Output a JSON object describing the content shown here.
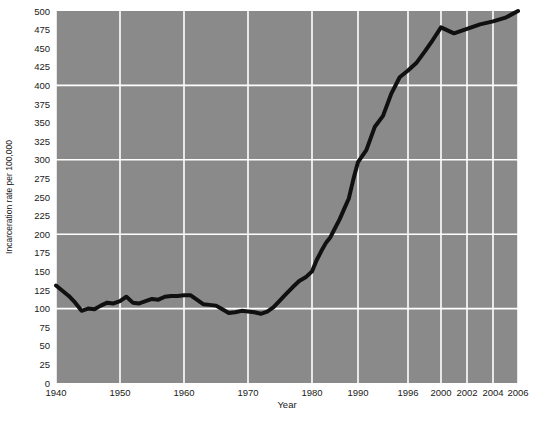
{
  "chart_data": {
    "type": "line",
    "title": "",
    "xlabel": "Year",
    "ylabel": "Incarceration rate per 100,000",
    "ylim": [
      0,
      500
    ],
    "ytick_step": 25,
    "ytick_labels": [
      "0",
      "25",
      "50",
      "75",
      "100",
      "125",
      "150",
      "175",
      "200",
      "225",
      "250",
      "275",
      "300",
      "325",
      "350",
      "375",
      "400",
      "425",
      "450",
      "475",
      "500"
    ],
    "ytick_values": [
      0,
      25,
      50,
      75,
      100,
      125,
      150,
      175,
      200,
      225,
      250,
      275,
      300,
      325,
      350,
      375,
      400,
      425,
      450,
      475,
      500
    ],
    "gridlines_y": [
      100,
      200,
      300,
      400
    ],
    "gridlines_x": [
      1940,
      1950,
      1960,
      1970,
      1980,
      1990,
      1996,
      2000,
      2002,
      2004,
      2006
    ],
    "xtick_labels": [
      "1940",
      "1950",
      "1960",
      "1970",
      "1980",
      "1990",
      "1996",
      "2000",
      "2002",
      "2004",
      "2006"
    ],
    "xtick_values": [
      1940,
      1950,
      1960,
      1970,
      1980,
      1990,
      1996,
      2000,
      2002,
      2004,
      2006
    ],
    "x_axis_scale": "piecewise-nonlinear",
    "grid": true,
    "legend": "none",
    "plot_background_color": "#8a8a8a",
    "gridline_color": "#ffffff",
    "line_color": "#101010",
    "line_width": 4,
    "page_background_color": "#ffffff",
    "text_color": "#1a1a1a",
    "series": [
      {
        "name": "Incarceration rate",
        "x": [
          1940,
          1941,
          1942,
          1943,
          1944,
          1945,
          1946,
          1947,
          1948,
          1949,
          1950,
          1951,
          1952,
          1953,
          1954,
          1955,
          1956,
          1957,
          1958,
          1959,
          1960,
          1961,
          1962,
          1963,
          1964,
          1965,
          1966,
          1967,
          1968,
          1969,
          1970,
          1971,
          1972,
          1973,
          1974,
          1975,
          1976,
          1977,
          1978,
          1979,
          1980,
          1981,
          1982,
          1983,
          1984,
          1985,
          1986,
          1987,
          1988,
          1989,
          1990,
          1991,
          1992,
          1993,
          1994,
          1995,
          1996,
          1997,
          1998,
          1999,
          2000,
          2001,
          2002,
          2003,
          2004,
          2005,
          2006
        ],
        "y": [
          131,
          124,
          117,
          108,
          97,
          100,
          99,
          104,
          108,
          107,
          110,
          116,
          108,
          107,
          110,
          113,
          112,
          116,
          117,
          117,
          118,
          118,
          112,
          106,
          105,
          104,
          99,
          94,
          95,
          97,
          96,
          95,
          93,
          96,
          102,
          111,
          120,
          129,
          137,
          142,
          150,
          165,
          177,
          188,
          196,
          208,
          220,
          234,
          248,
          274,
          297,
          313,
          344,
          359,
          389,
          411,
          420,
          430,
          445,
          461,
          478,
          470,
          476,
          482,
          486,
          491,
          500
        ]
      }
    ],
    "annotations": []
  },
  "axis": {
    "y_axis_title": "Incarceration rate per 100,000",
    "x_axis_title": "Year"
  }
}
